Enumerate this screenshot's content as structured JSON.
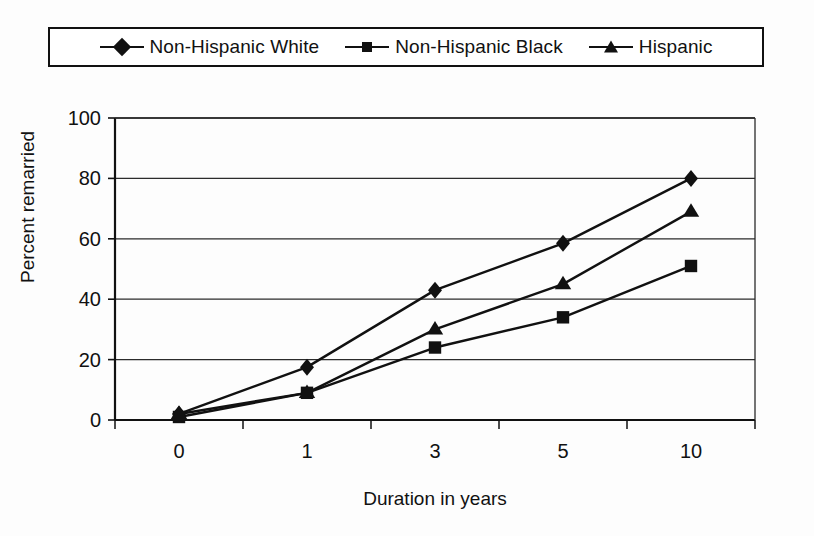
{
  "figure": {
    "kind": "scanned-line-chart",
    "ink_color": "#111111",
    "background_color": "#ffffff"
  },
  "legend": {
    "position": "top",
    "boxed": true,
    "entries": [
      {
        "label": "Non-Hispanic White",
        "marker": "diamond-marker"
      },
      {
        "label": "Non-Hispanic Black",
        "marker": "square-marker"
      },
      {
        "label": "Hispanic",
        "marker": "triangle-marker"
      }
    ]
  },
  "axes": {
    "y_title": "Percent remarried",
    "x_title": "Duration in years",
    "y_ticks": [
      "100",
      "80",
      "60",
      "40",
      "20",
      "0"
    ],
    "x_ticks": [
      "0",
      "1",
      "3",
      "5",
      "10"
    ]
  },
  "chart_data": {
    "type": "line",
    "title": "",
    "subtitle": "",
    "xlabel": "Duration in years",
    "ylabel": "Percent remarried",
    "categories": [
      "0",
      "1",
      "3",
      "5",
      "10"
    ],
    "x": [
      0,
      1,
      3,
      5,
      10
    ],
    "ylim": [
      0,
      100
    ],
    "xlim_categorical": true,
    "ytick_values": [
      0,
      20,
      40,
      60,
      80,
      100
    ],
    "grid": "horizontal",
    "legend_position": "top",
    "series": [
      {
        "name": "Non-Hispanic White",
        "marker": "diamond",
        "color": "#111111",
        "values": [
          2,
          17.5,
          43,
          58.5,
          80
        ]
      },
      {
        "name": "Non-Hispanic Black",
        "marker": "square",
        "color": "#111111",
        "values": [
          1,
          9,
          24,
          34,
          51
        ]
      },
      {
        "name": "Hispanic",
        "marker": "triangle",
        "color": "#111111",
        "values": [
          2,
          9,
          30,
          45,
          69
        ]
      }
    ]
  }
}
